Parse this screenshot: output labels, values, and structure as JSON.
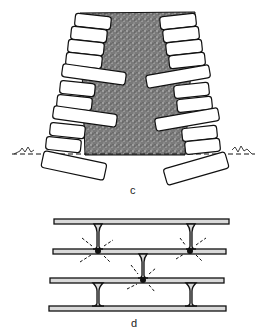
{
  "figures": [
    {
      "id": "c",
      "label": "c",
      "description": "Cross-section of a tapered dry-stone wall with through-stones, rubble hearting core and foundation stones set below ground line"
    },
    {
      "id": "d",
      "label": "d",
      "description": "Brick courses with mortar joints; stress points highlighted at vertical joint junctions"
    }
  ],
  "colors": {
    "stroke": "#111111",
    "fill_core": "#6b6b6b",
    "mortar": "#d9d9d9",
    "background": "#ffffff"
  }
}
